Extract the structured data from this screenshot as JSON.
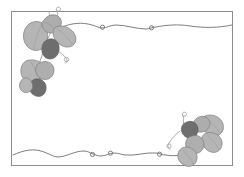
{
  "document": {
    "type": "decorative-page-border",
    "title": "Leaf and Vine Page Border",
    "canvas": {
      "width": 244,
      "height": 177
    },
    "background_color": "#ffffff"
  },
  "frame": {
    "name": "rectangular-border-frame",
    "stroke_color": "#8c8c8c",
    "stroke_width": 1,
    "x": 11.5,
    "y": 11.5,
    "width": 221,
    "height": 154
  },
  "palette": {
    "leaf_light": "#b5b5b5",
    "leaf_mid": "#a3a3a3",
    "leaf_dark": "#6e6e6e",
    "leaf_outline": "#7d7d7d",
    "vine_stroke": "#6f6f6f",
    "tendril_stroke": "#9a9a9a"
  },
  "ornaments": [
    {
      "id": "top-left-leaf-cluster",
      "name": "leaf-cluster-top-left",
      "corner": "top-left",
      "leaf_count": 8,
      "tendril_count": 3,
      "dominant_tone": "#b5b5b5",
      "accent_tone": "#6e6e6e"
    },
    {
      "id": "bottom-right-leaf-cluster",
      "name": "leaf-cluster-bottom-right",
      "corner": "bottom-right",
      "leaf_count": 6,
      "tendril_count": 2,
      "dominant_tone": "#b5b5b5",
      "accent_tone": "#6e6e6e"
    }
  ],
  "vines": [
    {
      "id": "top-vine",
      "name": "wavy-vine-top",
      "orientation": "horizontal",
      "edge": "top",
      "loop_nodes": 2,
      "stroke_color": "#6f6f6f"
    },
    {
      "id": "bottom-vine",
      "name": "wavy-vine-bottom",
      "orientation": "horizontal",
      "edge": "bottom",
      "loop_nodes": 3,
      "stroke_color": "#6f6f6f"
    }
  ]
}
